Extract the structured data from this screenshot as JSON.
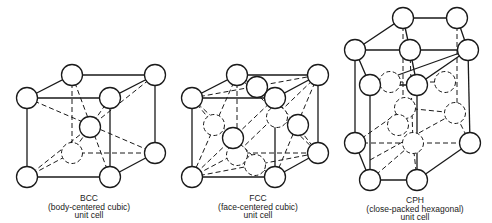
{
  "figures": [
    {
      "abbr": "BCC",
      "name": "(body-centered cubic)",
      "caption": "unit cell"
    },
    {
      "abbr": "FCC",
      "name": "(face-centered cubic)",
      "caption": "unit cell"
    },
    {
      "abbr": "CPH",
      "name": "(close-packed hexagonal)",
      "caption": "unit cell"
    }
  ],
  "colors": {
    "line": "#1a1a1a",
    "background": "#ffffff"
  }
}
